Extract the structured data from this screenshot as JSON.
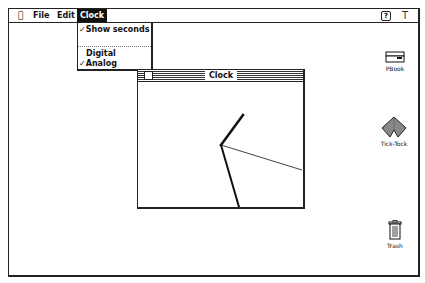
{
  "menubar": {
    "apple_icon": "apple-icon",
    "menus": [
      {
        "label": "File"
      },
      {
        "label": "Edit"
      },
      {
        "label": "Clock",
        "active": true
      }
    ],
    "help_icon": "?",
    "app_icon": "T"
  },
  "clock_menu": {
    "items": [
      {
        "label": "Show seconds",
        "checked": true,
        "check": "✓"
      },
      {
        "label": "Digital",
        "checked": false,
        "check": ""
      },
      {
        "label": "Analog",
        "checked": true,
        "check": "✓"
      }
    ]
  },
  "clock_window": {
    "title": "Clock",
    "mode": "Analog",
    "hands": {
      "hour": {
        "x1": 83,
        "y1": 63,
        "x2": 105,
        "y2": 33
      },
      "minute": {
        "x1": 83,
        "y1": 63,
        "x2": 101,
        "y2": 125
      },
      "second": {
        "x1": 83,
        "y1": 63,
        "x2": 164,
        "y2": 88
      }
    }
  },
  "desktop_icons": [
    {
      "label": "PBook",
      "icon": "notebook-icon"
    },
    {
      "label": "Tick-Tock",
      "icon": "diamond-app-icon"
    },
    {
      "label": "Trash",
      "icon": "trash-icon"
    }
  ],
  "colors": {
    "ink": "#111111",
    "paper": "#ffffff"
  }
}
